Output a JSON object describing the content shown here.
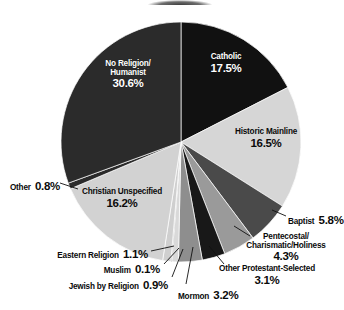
{
  "chart_data": {
    "type": "pie",
    "title": "",
    "xlabel": "",
    "ylabel": "",
    "legend_position": "none",
    "grid": false,
    "label_format": "name + percent",
    "start_angle_deg": 0,
    "direction": "clockwise",
    "units": "percent",
    "categories": [
      "Catholic",
      "Historic Mainline",
      "Baptist",
      "Pentecostal/ Charismatic/Holiness",
      "Other Protestant-Selected",
      "Mormon",
      "Jewish by Religion",
      "Muslim",
      "Eastern Religion",
      "Christian Unspecified",
      "Other",
      "No Religion/ Humanist"
    ],
    "values": [
      17.5,
      16.5,
      5.8,
      4.3,
      3.1,
      3.2,
      0.9,
      0.1,
      1.1,
      16.2,
      0.8,
      30.6
    ],
    "colors": [
      "#111111",
      "#d6d6d6",
      "#4a4a4a",
      "#9a9a9a",
      "#181818",
      "#8e8e8e",
      "#d9d9d9",
      "#242424",
      "#cfcfcf",
      "#d2d2d2",
      "#2a2a2a",
      "#2b2b2b"
    ],
    "slices": [
      {
        "label": "Catholic",
        "value_text": "17.5%",
        "value": 17.5,
        "color": "#111111",
        "label_placement": "inside",
        "text_color": "#ffffff"
      },
      {
        "label": "Historic Mainline",
        "value_text": "16.5%",
        "value": 16.5,
        "color": "#d6d6d6",
        "label_placement": "inside",
        "text_color": "#0b0b0b"
      },
      {
        "label": "Baptist",
        "value_text": "5.8%",
        "value": 5.8,
        "color": "#4a4a4a",
        "label_placement": "outside",
        "text_color": "#0b0b0b"
      },
      {
        "label": "Pentecostal/ Charismatic/Holiness",
        "value_text": "4.3%",
        "value": 4.3,
        "color": "#9a9a9a",
        "label_placement": "outside",
        "text_color": "#0b0b0b"
      },
      {
        "label": "Other Protestant-Selected",
        "value_text": "3.1%",
        "value": 3.1,
        "color": "#181818",
        "label_placement": "outside",
        "text_color": "#0b0b0b"
      },
      {
        "label": "Mormon",
        "value_text": "3.2%",
        "value": 3.2,
        "color": "#8e8e8e",
        "label_placement": "outside",
        "text_color": "#0b0b0b"
      },
      {
        "label": "Jewish by Religion",
        "value_text": "0.9%",
        "value": 0.9,
        "color": "#d9d9d9",
        "label_placement": "outside",
        "text_color": "#0b0b0b"
      },
      {
        "label": "Muslim",
        "value_text": "0.1%",
        "value": 0.1,
        "color": "#242424",
        "label_placement": "outside",
        "text_color": "#0b0b0b"
      },
      {
        "label": "Eastern Religion",
        "value_text": "1.1%",
        "value": 1.1,
        "color": "#cfcfcf",
        "label_placement": "outside",
        "text_color": "#0b0b0b"
      },
      {
        "label": "Christian Unspecified",
        "value_text": "16.2%",
        "value": 16.2,
        "color": "#d2d2d2",
        "label_placement": "inside",
        "text_color": "#0b0b0b"
      },
      {
        "label": "Other",
        "value_text": "0.8%",
        "value": 0.8,
        "color": "#2a2a2a",
        "label_placement": "outside",
        "text_color": "#0b0b0b"
      },
      {
        "label": "No Religion/ Humanist",
        "value_text": "30.6%",
        "value": 30.6,
        "color": "#2b2b2b",
        "label_placement": "inside",
        "text_color": "#ffffff"
      }
    ]
  },
  "labels": {
    "catholic": {
      "name": "Catholic",
      "percent": "17.5%"
    },
    "historic_mainline": {
      "name": "Historic Mainline",
      "percent": "16.5%"
    },
    "baptist": {
      "name": "Baptist",
      "percent": "5.8%"
    },
    "pentecostal": {
      "name_line1": "Pentecostal/",
      "name_line2": "Charismatic/Holiness",
      "percent": "4.3%"
    },
    "other_protestant": {
      "name": "Other Protestant-Selected",
      "percent": "3.1%"
    },
    "mormon": {
      "name": "Mormon",
      "percent": "3.2%"
    },
    "jewish": {
      "name": "Jewish by Religion",
      "percent": "0.9%"
    },
    "muslim": {
      "name": "Muslim",
      "percent": "0.1%"
    },
    "eastern": {
      "name": "Eastern Religion",
      "percent": "1.1%"
    },
    "christian_unspecified": {
      "name": "Christian Unspecified",
      "percent": "16.2%"
    },
    "other": {
      "name": "Other",
      "percent": "0.8%"
    },
    "no_religion": {
      "name_line1": "No Religion/",
      "name_line2": "Humanist",
      "percent": "30.6%"
    }
  }
}
